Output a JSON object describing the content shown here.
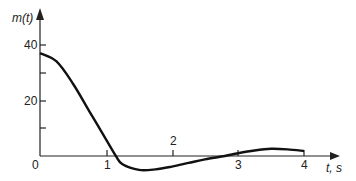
{
  "chart_data": {
    "type": "line",
    "title": "",
    "xlabel": "t, s",
    "ylabel": "m(t)",
    "x_ticks": [
      "0",
      "1",
      "2",
      "3",
      "4"
    ],
    "y_ticks": [
      "20",
      "40"
    ],
    "xlim": [
      0,
      4.3
    ],
    "ylim": [
      -5,
      45
    ],
    "grid": false,
    "series": [
      {
        "name": "m(t)",
        "x": [
          0,
          0.25,
          0.5,
          0.75,
          1.0,
          1.15,
          1.25,
          1.5,
          1.75,
          2.0,
          2.25,
          2.5,
          2.8,
          3.0,
          3.25,
          3.5,
          3.75,
          4.0
        ],
        "values": [
          37,
          34,
          26,
          16,
          6,
          0,
          -3,
          -5,
          -4.8,
          -3.8,
          -2.5,
          -1.2,
          0,
          1,
          2,
          2.6,
          2.4,
          1.8
        ]
      }
    ]
  },
  "labels": {
    "origin": "0",
    "x1": "1",
    "x2": "2",
    "x3": "3",
    "x4": "4",
    "y20": "20",
    "y40": "40",
    "xaxis": "t, s",
    "yaxis": "m(t)"
  }
}
